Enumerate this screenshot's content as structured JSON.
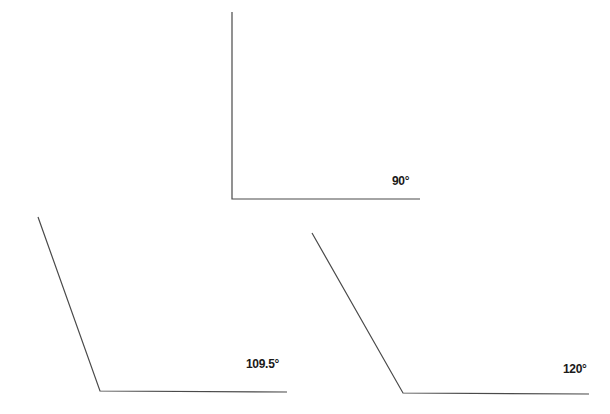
{
  "diagram": {
    "line_color": "#4a4a4a",
    "angles": [
      {
        "label": "90°",
        "degrees": 90,
        "vertex": [
          232,
          199
        ],
        "arm_end": [
          232,
          12
        ],
        "base_end": [
          420,
          199
        ],
        "label_pos": [
          392,
          176
        ]
      },
      {
        "label": "109.5°",
        "degrees": 109.5,
        "vertex": [
          100,
          391
        ],
        "arm_end": [
          38,
          217
        ],
        "base_end": [
          287,
          392
        ],
        "label_pos": [
          246,
          359
        ]
      },
      {
        "label": "120°",
        "degrees": 120,
        "vertex": [
          403,
          393
        ],
        "arm_end": [
          312,
          233
        ],
        "base_end": [
          589,
          394
        ],
        "label_pos": [
          563,
          364
        ]
      }
    ]
  }
}
